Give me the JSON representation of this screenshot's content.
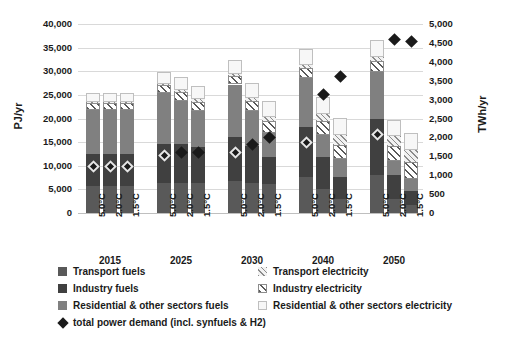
{
  "chart_data": {
    "type": "bar",
    "title": "",
    "xlabel": "",
    "ylabel": "PJ/yr",
    "ylabel_right": "TWh/yr",
    "ylim": [
      0,
      40000
    ],
    "ylim_right": [
      0,
      5000
    ],
    "grid": true,
    "stacked": true,
    "legend_position": "bottom",
    "yticks": [
      "0",
      "5,000",
      "10,000",
      "15,000",
      "20,000",
      "25,000",
      "30,000",
      "35,000",
      "40,000"
    ],
    "yticks_right": [
      "0",
      "500",
      "1,000",
      "1,500",
      "2,000",
      "2,500",
      "3,000",
      "3,500",
      "4,000",
      "4,500",
      "5,000"
    ],
    "group_labels": [
      "2015",
      "2025",
      "2030",
      "2040",
      "2050"
    ],
    "scenario_labels": [
      "5.0°C",
      "2.0°C",
      "1.5°C"
    ],
    "categories": [
      "2015 5.0°C",
      "2015 2.0°C",
      "2015 1.5°C",
      "2025 5.0°C",
      "2025 2.0°C",
      "2025 1.5°C",
      "2030 5.0°C",
      "2030 2.0°C",
      "2030 1.5°C",
      "2040 5.0°C",
      "2040 2.0°C",
      "2040 1.5°C",
      "2050 5.0°C",
      "2050 2.0°C",
      "2050 1.5°C"
    ],
    "series": [
      {
        "name": "Transport fuels",
        "key": "tf",
        "color": "#595959",
        "pattern": "solid",
        "values": [
          5800,
          5800,
          5800,
          6400,
          6400,
          6300,
          6700,
          6400,
          6100,
          7600,
          5000,
          3000,
          8000,
          3000,
          1700
        ]
      },
      {
        "name": "Industry fuels",
        "key": "if",
        "color": "#404040",
        "pattern": "solid",
        "values": [
          6700,
          6700,
          6700,
          8300,
          8200,
          7600,
          9300,
          7700,
          5700,
          10700,
          6900,
          4600,
          12000,
          5000,
          3000
        ]
      },
      {
        "name": "Residential & other sectors fuels",
        "key": "rf",
        "color": "#808080",
        "pattern": "solid",
        "values": [
          9400,
          9400,
          9400,
          10700,
          9100,
          7700,
          11200,
          7400,
          5100,
          10200,
          4700,
          3800,
          9800,
          3000,
          2600
        ]
      },
      {
        "name": "Transport electricity",
        "key": "te",
        "color": "#f2f2f2",
        "pattern": "hatch-light",
        "values": [
          200,
          200,
          200,
          300,
          400,
          500,
          400,
          700,
          1000,
          600,
          1500,
          2100,
          800,
          2100,
          2700
        ]
      },
      {
        "name": "Industry electricity",
        "key": "ie",
        "color": "#ffffff",
        "pattern": "hatch-dark",
        "values": [
          1400,
          1400,
          1400,
          1700,
          1900,
          2000,
          1900,
          2200,
          2500,
          2200,
          2800,
          3100,
          2400,
          3100,
          3400
        ]
      },
      {
        "name": "Residential & other sectors electricity",
        "key": "re",
        "color": "#f7f7f7",
        "pattern": "plain-outline",
        "values": [
          1900,
          1900,
          1900,
          2500,
          2800,
          2800,
          2900,
          3200,
          3300,
          3400,
          3700,
          3500,
          3600,
          3500,
          3500
        ]
      }
    ],
    "marker_series": {
      "name": "total power demand (incl. synfuels & H2)",
      "marker": "diamond",
      "axis": "right",
      "unit": "TWh/yr",
      "values": [
        1230,
        1230,
        1230,
        1520,
        1590,
        1600,
        1600,
        1810,
        2000,
        1870,
        3130,
        3620,
        2080,
        4600,
        4540
      ],
      "filled": [
        false,
        false,
        false,
        false,
        true,
        true,
        false,
        true,
        true,
        false,
        true,
        true,
        false,
        true,
        true
      ]
    }
  },
  "legend": {
    "items": [
      {
        "label": "Transport fuels",
        "swatch": "s-tf"
      },
      {
        "label": "Industry fuels",
        "swatch": "s-if"
      },
      {
        "label": "Residential & other sectors fuels",
        "swatch": "s-rf"
      },
      {
        "label": "total power demand (incl. synfuels & H2)",
        "swatch": "diamond"
      },
      {
        "label": "Transport electricity",
        "swatch": "s-te"
      },
      {
        "label": "Industry electricity",
        "swatch": "s-ie"
      },
      {
        "label": "Residential & other sectors electricity",
        "swatch": "s-re"
      }
    ]
  }
}
